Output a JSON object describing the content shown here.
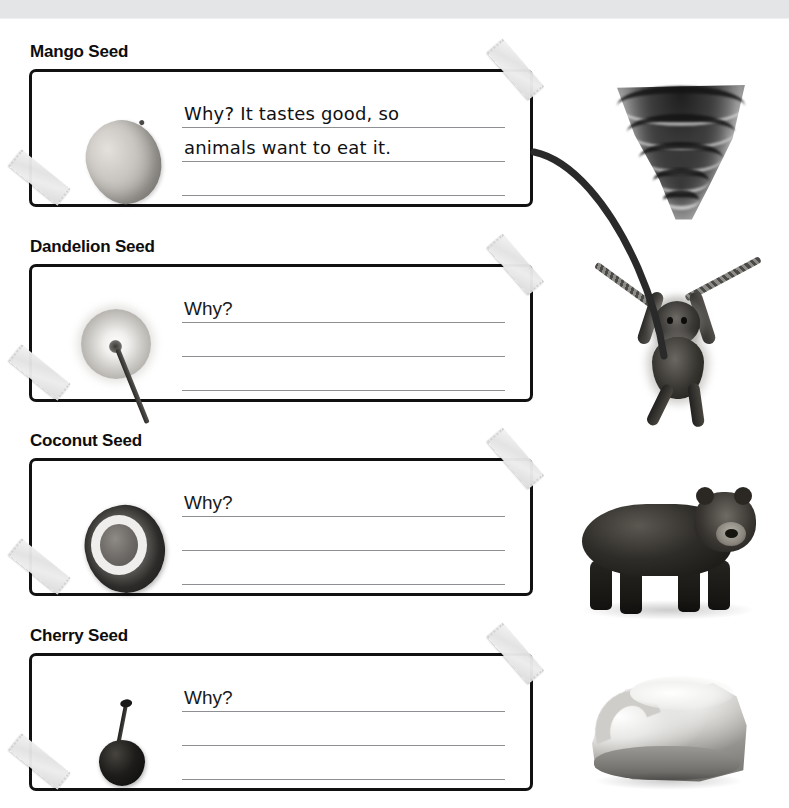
{
  "page": {
    "header_strip_color": "#e4e5e7",
    "background_color": "#ffffff",
    "ink_color": "#111111",
    "rule_color": "#8d8f92",
    "tape_color": "#e6e6e6"
  },
  "sections": [
    {
      "title": "Mango Seed",
      "seed_icon": "mango-seed-image",
      "lines": [
        {
          "prompt": "Why?",
          "answer": "It tastes good, so"
        },
        {
          "prompt": "",
          "answer": "animals want to eat it."
        },
        {
          "prompt": "",
          "answer": ""
        }
      ],
      "tape_top_right": "tape-piece",
      "tape_bottom_left": "tape-piece",
      "agent_icon": "tornado-image",
      "agent_label": "Tornado",
      "connector": "curved-line-to-monkey"
    },
    {
      "title": "Dandelion Seed",
      "seed_icon": "dandelion-seed-image",
      "lines": [
        {
          "prompt": "Why?",
          "answer": ""
        },
        {
          "prompt": "",
          "answer": ""
        },
        {
          "prompt": "",
          "answer": ""
        }
      ],
      "tape_top_right": "tape-piece",
      "tape_bottom_left": "tape-piece",
      "agent_icon": "monkey-image",
      "agent_label": "Monkey"
    },
    {
      "title": "Coconut Seed",
      "seed_icon": "coconut-seed-image",
      "lines": [
        {
          "prompt": "Why?",
          "answer": ""
        },
        {
          "prompt": "",
          "answer": ""
        },
        {
          "prompt": "",
          "answer": ""
        }
      ],
      "tape_top_right": "tape-piece",
      "tape_bottom_left": "tape-piece",
      "agent_icon": "bear-image",
      "agent_label": "Bear"
    },
    {
      "title": "Cherry Seed",
      "seed_icon": "cherry-seed-image",
      "lines": [
        {
          "prompt": "Why?",
          "answer": ""
        },
        {
          "prompt": "",
          "answer": ""
        },
        {
          "prompt": "",
          "answer": ""
        }
      ],
      "tape_top_right": "tape-piece",
      "tape_bottom_left": "tape-piece",
      "agent_icon": "wave-image",
      "agent_label": "Ocean Wave"
    }
  ]
}
